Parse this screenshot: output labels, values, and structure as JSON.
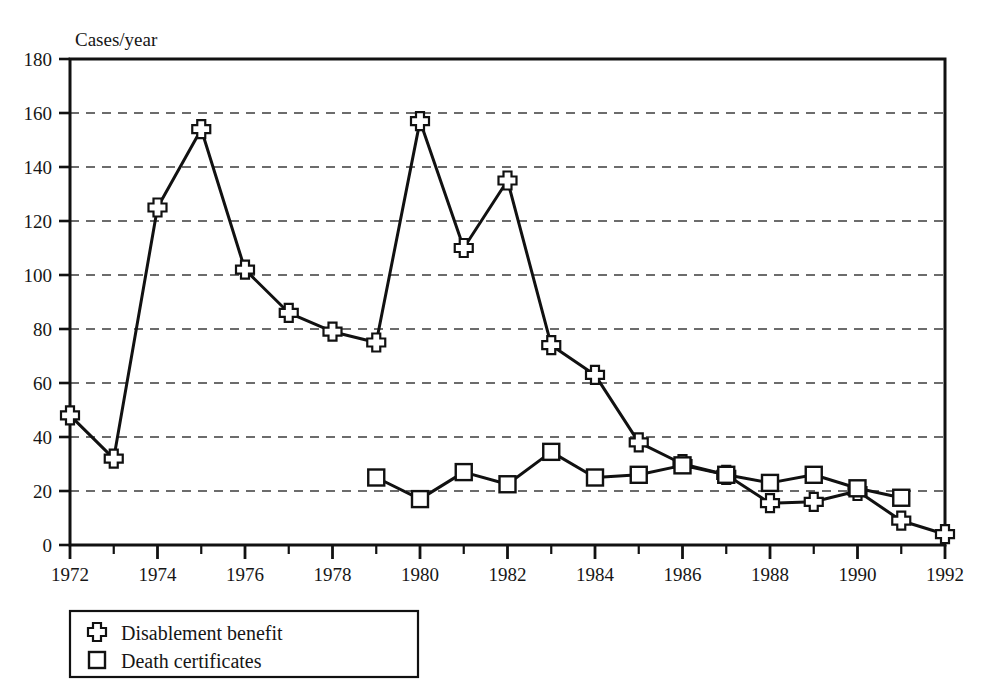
{
  "figure": {
    "clipped_heading": "",
    "axis_unit_label": "Cases/year"
  },
  "chart_data": {
    "type": "line",
    "title": "",
    "xlabel": "",
    "ylabel": "Cases/year",
    "xlim": [
      1972,
      1992
    ],
    "ylim": [
      0,
      180
    ],
    "yticks": [
      0,
      20,
      40,
      60,
      80,
      100,
      120,
      140,
      160,
      180
    ],
    "xticks": [
      1972,
      1974,
      1976,
      1978,
      1980,
      1982,
      1984,
      1986,
      1988,
      1990,
      1992
    ],
    "xtick_labels": [
      "1972",
      "1974",
      "1976",
      "1978",
      "1980",
      "1982",
      "1984",
      "1986",
      "1988",
      "1990",
      "1992"
    ],
    "ytick_labels": [
      "0",
      "20",
      "40",
      "60",
      "80",
      "100",
      "120",
      "140",
      "160",
      "180"
    ],
    "grid": "horizontal-dashed",
    "legend_position": "below-left",
    "x": [
      1972,
      1973,
      1974,
      1975,
      1976,
      1977,
      1978,
      1979,
      1980,
      1981,
      1982,
      1983,
      1984,
      1985,
      1986,
      1987,
      1988,
      1989,
      1990,
      1991,
      1992
    ],
    "series": [
      {
        "name": "Disablement benefit",
        "marker": "cross",
        "x": [
          1972,
          1973,
          1974,
          1975,
          1976,
          1977,
          1978,
          1979,
          1980,
          1981,
          1982,
          1983,
          1984,
          1985,
          1986,
          1987,
          1988,
          1989,
          1990,
          1991,
          1992
        ],
        "values": [
          48,
          32,
          125,
          154,
          102,
          86,
          79,
          75,
          157,
          110,
          135,
          74,
          63,
          38,
          30,
          26,
          15.5,
          16,
          20,
          9,
          4
        ]
      },
      {
        "name": "Death certificates",
        "marker": "square",
        "x": [
          1979,
          1980,
          1981,
          1982,
          1983,
          1984,
          1985,
          1986,
          1987,
          1988,
          1989,
          1990,
          1991
        ],
        "values": [
          25,
          17,
          27,
          22.5,
          34.5,
          25,
          26,
          29.5,
          26,
          23,
          26,
          21,
          17.5
        ]
      }
    ]
  },
  "legend": {
    "items": [
      {
        "label": "Disablement benefit",
        "marker": "cross"
      },
      {
        "label": "Death certificates",
        "marker": "square"
      }
    ]
  }
}
